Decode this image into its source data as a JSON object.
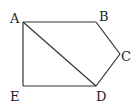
{
  "diagram": {
    "type": "pentagon-with-diagonal",
    "points": {
      "A": {
        "label": "A",
        "x": 23,
        "y": 22
      },
      "B": {
        "label": "B",
        "x": 96,
        "y": 22
      },
      "C": {
        "label": "C",
        "x": 120,
        "y": 54
      },
      "D": {
        "label": "D",
        "x": 96,
        "y": 86
      },
      "E": {
        "label": "E",
        "x": 23,
        "y": 86
      }
    },
    "edges": [
      [
        "A",
        "B"
      ],
      [
        "B",
        "C"
      ],
      [
        "C",
        "D"
      ],
      [
        "D",
        "E"
      ],
      [
        "E",
        "A"
      ],
      [
        "A",
        "D"
      ]
    ],
    "line_color": "#333333"
  }
}
